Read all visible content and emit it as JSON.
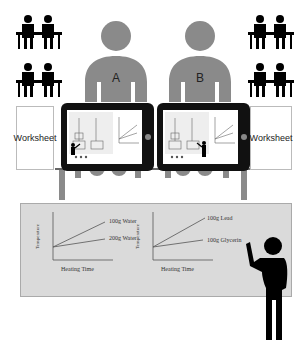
{
  "diagram": {
    "title": "",
    "students": [
      {
        "label": "A",
        "color": "#8a8a8a"
      },
      {
        "label": "B",
        "color": "#8a8a8a"
      }
    ],
    "worksheets": [
      {
        "label": "Worksheet",
        "side": "left"
      },
      {
        "label": "Worksheet",
        "side": "right"
      }
    ],
    "classroom_icons": {
      "left_groups": 2,
      "right_groups": 2,
      "color": "#000000"
    },
    "tablets": {
      "count": 2,
      "frame_color": "#111111"
    },
    "whiteboard": {
      "background": "#dadada",
      "charts": [
        {
          "ylabel": "Temperature",
          "xlabel": "Heating Time",
          "series": [
            {
              "name": "100g Water"
            },
            {
              "name": "200g Water"
            }
          ]
        },
        {
          "ylabel": "Temperature",
          "xlabel": "Heating Time",
          "series": [
            {
              "name": "100g Lead"
            },
            {
              "name": "100g Glycerin"
            }
          ]
        }
      ]
    },
    "teacher": {
      "color": "#000000"
    }
  }
}
